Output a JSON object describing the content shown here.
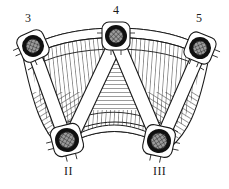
{
  "figure": {
    "width": 229,
    "height": 189,
    "background_color": "#ffffff",
    "line_color": "#1a1a1a",
    "hatch_color": "#3a3a3a",
    "bearing_ring_color": "#101010",
    "bearing_fill_color": "#8f8f8f"
  },
  "node_labels": [
    {
      "text": "3",
      "x": 25,
      "y": 12,
      "name": "node-label-3"
    },
    {
      "text": "4",
      "x": 113,
      "y": 4,
      "name": "node-label-4"
    },
    {
      "text": "5",
      "x": 196,
      "y": 12,
      "name": "node-label-5"
    }
  ],
  "support_labels": [
    {
      "text": "II",
      "x": 64,
      "y": 165,
      "name": "support-label-ii"
    },
    {
      "text": "III",
      "x": 153,
      "y": 165,
      "name": "support-label-iii"
    }
  ],
  "bearings": [
    {
      "id": "3",
      "cx": 33,
      "cy": 46,
      "r_outer": 16,
      "r_ring": 11,
      "r_core": 7.5,
      "rot": -24,
      "name": "bearing-node-3"
    },
    {
      "id": "4",
      "cx": 116,
      "cy": 36,
      "r_outer": 16,
      "r_ring": 11,
      "r_core": 7.5,
      "rot": 0,
      "name": "bearing-node-4"
    },
    {
      "id": "5",
      "cx": 200,
      "cy": 48,
      "r_outer": 16,
      "r_ring": 11,
      "r_core": 7.5,
      "rot": 22,
      "name": "bearing-node-5"
    },
    {
      "id": "II",
      "cx": 67,
      "cy": 140,
      "r_outer": 17,
      "r_ring": 12,
      "r_core": 8.5,
      "rot": -14,
      "name": "bearing-support-ii"
    },
    {
      "id": "III",
      "cx": 159,
      "cy": 141,
      "r_outer": 17,
      "r_ring": 12,
      "r_core": 8.5,
      "rot": 12,
      "name": "bearing-support-iii"
    }
  ],
  "members": [
    {
      "from": "3",
      "to": "II",
      "name": "member-3-ii"
    },
    {
      "from": "4",
      "to": "II",
      "name": "member-4-ii"
    },
    {
      "from": "4",
      "to": "III",
      "name": "member-4-iii"
    },
    {
      "from": "5",
      "to": "III",
      "name": "member-5-iii"
    }
  ],
  "panels": [
    {
      "name": "panel-left-upper",
      "hatch": "near-vertical"
    },
    {
      "name": "panel-center-upper",
      "hatch": "horizontal"
    },
    {
      "name": "panel-right-upper",
      "hatch": "near-vertical"
    },
    {
      "name": "panel-left-lower",
      "hatch": "diagonal"
    },
    {
      "name": "panel-center-lower",
      "hatch": "radial-vertical"
    },
    {
      "name": "panel-right-lower",
      "hatch": "diagonal"
    }
  ],
  "chords": [
    {
      "name": "top-chord-arc",
      "description": "upper curved flange band, unhatched"
    },
    {
      "name": "bottom-chord-arc",
      "description": "lower curved flange band, unhatched"
    }
  ]
}
